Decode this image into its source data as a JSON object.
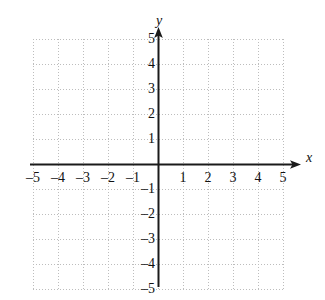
{
  "figure": {
    "kind": "cartesian-coordinate-grid",
    "background_color": "#ffffff",
    "axis_color": "#1a1a1a",
    "grid_color": "#bdbdbd",
    "label_color": "#111111"
  },
  "axes": {
    "x_name": "x",
    "y_name": "y",
    "x_arrow": "right",
    "y_arrow": "up"
  },
  "chart_data": {
    "type": "scatter",
    "title": "",
    "subtitle": "",
    "xlabel": "x",
    "ylabel": "y",
    "xlim": [
      -5,
      5
    ],
    "ylim": [
      -5,
      5
    ],
    "x_tick_step": 1,
    "y_tick_step": 1,
    "grid": true,
    "grid_style": "dotted",
    "legend": false,
    "legend_position": "none",
    "annotations": [],
    "series": [],
    "x_tick_labels": [
      "–5",
      "–4",
      "–3",
      "–2",
      "–1",
      "1",
      "2",
      "3",
      "4",
      "5"
    ],
    "x_tick_values": [
      -5,
      -4,
      -3,
      -2,
      -1,
      1,
      2,
      3,
      4,
      5
    ],
    "y_tick_labels": [
      "5",
      "4",
      "3",
      "2",
      "1",
      "–1",
      "–2",
      "–3",
      "–4",
      "–5"
    ],
    "y_tick_values": [
      5,
      4,
      3,
      2,
      1,
      -1,
      -2,
      -3,
      -4,
      -5
    ]
  }
}
